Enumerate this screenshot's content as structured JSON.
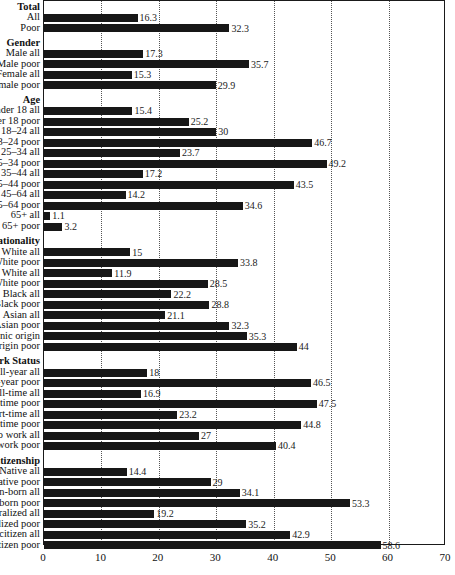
{
  "chart_data": {
    "type": "bar",
    "orientation": "horizontal",
    "title": "",
    "xlabel": "",
    "ylabel": "",
    "xlim": [
      0,
      70
    ],
    "xticks": [
      0,
      10,
      20,
      30,
      40,
      50,
      60,
      70
    ],
    "grid": true,
    "legend": "none",
    "bar_color": "#171717",
    "groups": [
      {
        "header": "Total",
        "rows": [
          {
            "label": "All",
            "value": 16.3
          },
          {
            "label": "Poor",
            "value": 32.3
          }
        ]
      },
      {
        "header": "Gender",
        "rows": [
          {
            "label": "Male all",
            "value": 17.3
          },
          {
            "label": "Male poor",
            "value": 35.7
          },
          {
            "label": "Female all",
            "value": 15.3
          },
          {
            "label": "Female poor",
            "value": 29.9
          }
        ]
      },
      {
        "header": "Age",
        "rows": [
          {
            "label": "Under 18 all",
            "value": 15.4
          },
          {
            "label": "Under 18 poor",
            "value": 25.2
          },
          {
            "label": "18–24 all",
            "value": 30
          },
          {
            "label": "18–24 poor",
            "value": 46.7
          },
          {
            "label": "25–34 all",
            "value": 23.7
          },
          {
            "label": "25–34 poor",
            "value": 49.2
          },
          {
            "label": "35–44 all",
            "value": 17.2
          },
          {
            "label": "35–44 poor",
            "value": 43.5
          },
          {
            "label": "45–64 all",
            "value": 14.2
          },
          {
            "label": "45–64 poor",
            "value": 34.6
          },
          {
            "label": "65+ all",
            "value": 1.1
          },
          {
            "label": "65+ poor",
            "value": 3.2
          }
        ]
      },
      {
        "header": "Nationality",
        "rows": [
          {
            "label": "Non-Hispanic White all",
            "value": 15
          },
          {
            "label": "Non-Hispanic White poor",
            "value": 33.8
          },
          {
            "label": "Hispanic White all",
            "value": 11.9
          },
          {
            "label": "Hispanic White poor",
            "value": 28.5
          },
          {
            "label": "Black all",
            "value": 22.2
          },
          {
            "label": "Black poor",
            "value": 28.8
          },
          {
            "label": "Asian all",
            "value": 21.1
          },
          {
            "label": "Asian poor",
            "value": 32.3
          },
          {
            "label": "Hispanic origin",
            "value": 35.3
          },
          {
            "label": "Hispanic origin poor",
            "value": 44
          }
        ]
      },
      {
        "header": "Work Status",
        "rows": [
          {
            "label": "Full-year all",
            "value": 18
          },
          {
            "label": "Full-year poor",
            "value": 46.5
          },
          {
            "label": "Full-time all",
            "value": 16.9
          },
          {
            "label": "Full-time poor",
            "value": 47.5
          },
          {
            "label": "Part-time all",
            "value": 23.2
          },
          {
            "label": "Part-time poor",
            "value": 44.8
          },
          {
            "label": "No work all",
            "value": 27
          },
          {
            "label": "No work poor",
            "value": 40.4
          }
        ]
      },
      {
        "header": "Citizenship",
        "rows": [
          {
            "label": "Native all",
            "value": 14.4
          },
          {
            "label": "Native poor",
            "value": 29
          },
          {
            "label": "Foreign-born all",
            "value": 34.1
          },
          {
            "label": "Foreign-born poor",
            "value": 53.3
          },
          {
            "label": "Naturalized all",
            "value": 19.2
          },
          {
            "label": "Naturalized poor",
            "value": 35.2
          },
          {
            "label": "Non-citizen all",
            "value": 42.9
          },
          {
            "label": "Non-citizen poor",
            "value": 58.6
          }
        ]
      }
    ]
  }
}
